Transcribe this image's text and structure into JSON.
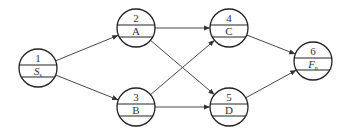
{
  "diagram": {
    "type": "activity-on-node network",
    "nodes": [
      {
        "id": 1,
        "number": "1",
        "label": "S",
        "sub": "s",
        "italic": true,
        "cx": 38,
        "cy": 68
      },
      {
        "id": 2,
        "number": "2",
        "label": "A",
        "sub": "",
        "italic": false,
        "cx": 136,
        "cy": 28
      },
      {
        "id": 3,
        "number": "3",
        "label": "B",
        "sub": "",
        "italic": false,
        "cx": 136,
        "cy": 107
      },
      {
        "id": 4,
        "number": "4",
        "label": "C",
        "sub": "",
        "italic": false,
        "cx": 229,
        "cy": 28
      },
      {
        "id": 5,
        "number": "5",
        "label": "D",
        "sub": "",
        "italic": false,
        "cx": 229,
        "cy": 107
      },
      {
        "id": 6,
        "number": "6",
        "label": "F",
        "sub": "n",
        "italic": true,
        "cx": 313,
        "cy": 61
      }
    ],
    "edges": [
      {
        "from": 1,
        "to": 2
      },
      {
        "from": 1,
        "to": 3
      },
      {
        "from": 2,
        "to": 4
      },
      {
        "from": 2,
        "to": 5
      },
      {
        "from": 3,
        "to": 4
      },
      {
        "from": 3,
        "to": 5
      },
      {
        "from": 4,
        "to": 6
      },
      {
        "from": 5,
        "to": 6
      }
    ],
    "radius": 19
  }
}
